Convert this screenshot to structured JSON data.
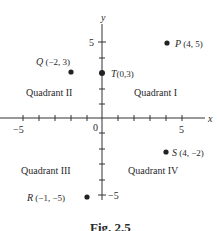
{
  "figure": {
    "caption": "Fig. 2.5",
    "axes": {
      "x_label": "x",
      "y_label": "y",
      "origin_label": "0",
      "x_tick_labels": [
        {
          "value": -5,
          "text": "−5"
        },
        {
          "value": 5,
          "text": "5"
        }
      ],
      "y_tick_labels": [
        {
          "value": 5,
          "text": "5"
        },
        {
          "value": -5,
          "text": "−5"
        }
      ],
      "x_range": [
        -6,
        6
      ],
      "y_range": [
        -6,
        6
      ]
    },
    "quadrants": [
      {
        "name": "Quadrant I"
      },
      {
        "name": "Quadrant II"
      },
      {
        "name": "Quadrant III"
      },
      {
        "name": "Quadrant IV"
      }
    ],
    "points": [
      {
        "letter": "P",
        "coords": " (4, 5)",
        "x": 4,
        "y": 5
      },
      {
        "letter": "Q",
        "coords": " (−2, 3)",
        "x": -2,
        "y": 3
      },
      {
        "letter": "T",
        "coords": "(0,3)",
        "x": 0,
        "y": 3
      },
      {
        "letter": "S",
        "coords": " (4, −2)",
        "x": 4,
        "y": -2
      },
      {
        "letter": "R",
        "coords": " (−1, −5)",
        "x": -1,
        "y": -5
      }
    ]
  }
}
